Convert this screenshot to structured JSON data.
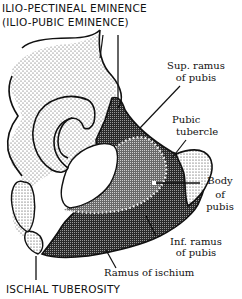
{
  "figure": {
    "type": "anatomical-diagram"
  },
  "labels": {
    "top_title_line1": "ILIO-PECTINEAL EMINENCE",
    "top_title_line2": "(ILIO-PUBIC EMINENCE)",
    "sup_ramus_line1": "Sup. ramus",
    "sup_ramus_line2": "of pubis",
    "pubic_tubercle_line1": "Pubic",
    "pubic_tubercle_line2": "tubercle",
    "body_pubis_line1": "Body",
    "body_pubis_line2": "of",
    "body_pubis_line3": "pubis",
    "inf_ramus_line1": "Inf. ramus",
    "inf_ramus_line2": "of pubis",
    "ramus_ischium": "Ramus of ischium",
    "bottom_title": "ISCHIAL TUBEROSITY"
  },
  "colors": {
    "ink": "#111111",
    "paper": "#ffffff",
    "stipple": "#555555",
    "dark_hatch": "#2a2a2a",
    "mid_hatch": "#6a6a6a"
  }
}
